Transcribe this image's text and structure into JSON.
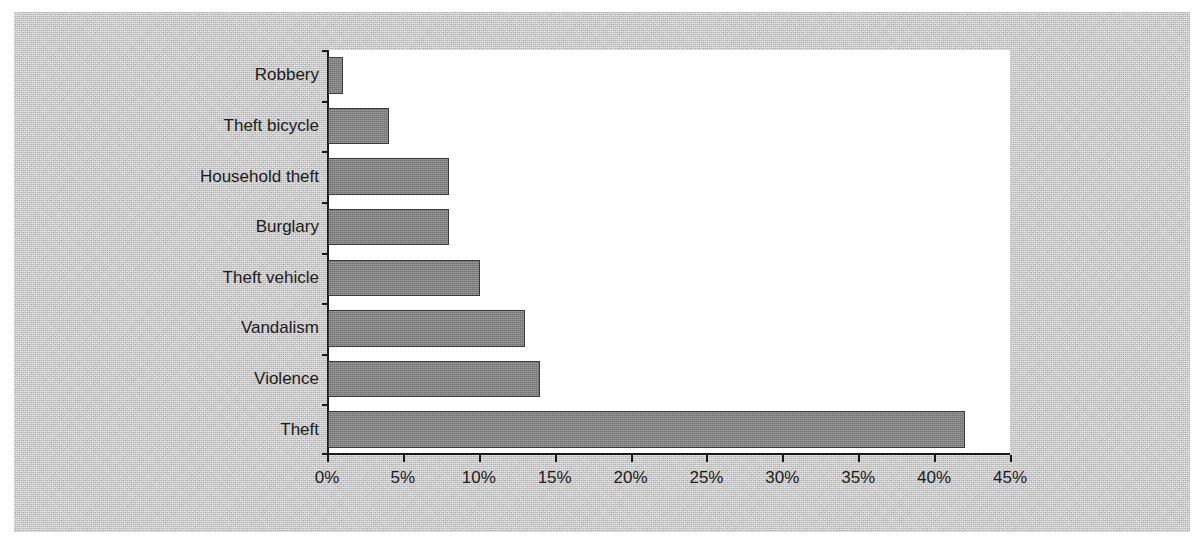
{
  "figure": {
    "background_color": "#c9c9c9",
    "plot_background_color": "#ffffff",
    "bar_fill_color": "#848484",
    "bar_edge_color": "#3a3a3a",
    "axis_color": "#1a1a1a",
    "text_color": "#1d1d1d"
  },
  "chart_data": {
    "type": "bar",
    "orientation": "horizontal",
    "title": "",
    "xlabel": "",
    "ylabel": "",
    "categories": [
      "Robbery",
      "Theft bicycle",
      "Household theft",
      "Burglary",
      "Theft vehicle",
      "Vandalism",
      "Violence",
      "Theft"
    ],
    "values": [
      1,
      4,
      8,
      8,
      10,
      13,
      14,
      42
    ],
    "value_unit": "%",
    "xlim": [
      0,
      45
    ],
    "xticks": [
      0,
      5,
      10,
      15,
      20,
      25,
      30,
      35,
      40,
      45
    ],
    "xticklabels": [
      "0%",
      "5%",
      "10%",
      "15%",
      "20%",
      "25%",
      "30%",
      "35%",
      "40%",
      "45%"
    ],
    "grid": false,
    "legend": null,
    "series": [
      {
        "name": "share",
        "values": [
          1,
          4,
          8,
          8,
          10,
          13,
          14,
          42
        ]
      }
    ]
  }
}
